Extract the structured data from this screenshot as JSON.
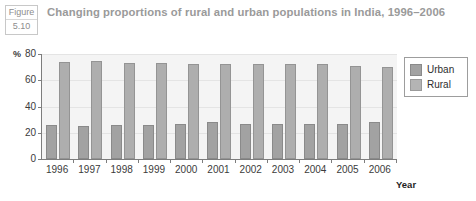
{
  "figure": {
    "tag_word": "Figure",
    "tag_number": "5.10",
    "caption": "Changing proportions of rural and urban populations in India, 1996–2006"
  },
  "axis_title_x": "Year",
  "axis_unit_y": "%",
  "chart_data": {
    "type": "bar",
    "title": "Changing proportions of rural and urban populations in India, 1996–2006",
    "xlabel": "Year",
    "ylabel": "%",
    "ylim": [
      0,
      80
    ],
    "yticks": [
      0,
      20,
      40,
      60,
      80
    ],
    "grid": true,
    "legend_position": "right",
    "categories": [
      "1996",
      "1997",
      "1998",
      "1999",
      "2000",
      "2001",
      "2002",
      "2003",
      "2004",
      "2005",
      "2006"
    ],
    "series": [
      {
        "name": "Urban",
        "color": "#a2a2a2",
        "values": [
          26,
          25,
          26,
          26,
          27,
          28,
          27,
          27,
          27,
          27,
          28
        ]
      },
      {
        "name": "Rural",
        "color": "#b4b4b4",
        "values": [
          74,
          75,
          73,
          73,
          72,
          72,
          72,
          72,
          72,
          71,
          70
        ]
      }
    ]
  }
}
